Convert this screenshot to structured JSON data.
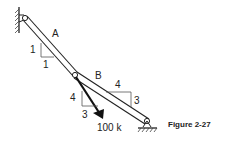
{
  "figure": {
    "caption": "Figure 2-27",
    "members": [
      {
        "label": "A",
        "slope": {
          "rise": "1",
          "run": "1"
        }
      },
      {
        "label": "B",
        "slope": {
          "run": "4",
          "rise": "3"
        }
      }
    ],
    "load": {
      "label": "100 k",
      "slope": {
        "vertical": "4",
        "horizontal": "3"
      }
    },
    "supports": [
      "pin-wall-left",
      "pin-ground-right"
    ]
  }
}
